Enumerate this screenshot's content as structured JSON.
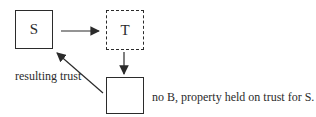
{
  "diagram": {
    "box_s": {
      "label": "S",
      "style": "solid"
    },
    "box_t": {
      "label": "T",
      "style": "dashed"
    },
    "box_property": {
      "label": "",
      "style": "solid"
    },
    "captions": {
      "resulting_trust": "resulting trust",
      "note": "no B, property held on trust for S."
    },
    "arrows": [
      {
        "name": "arrow-s-to-t",
        "from": "box_s",
        "to": "box_t"
      },
      {
        "name": "arrow-t-to-property-box",
        "from": "box_t",
        "to": "box_property"
      },
      {
        "name": "arrow-property-box-to-s",
        "from": "box_property",
        "to": "box_s"
      }
    ],
    "colors": {
      "line": "#2b2b2b",
      "text": "#2b2b2b",
      "background": "#ffffff"
    }
  }
}
